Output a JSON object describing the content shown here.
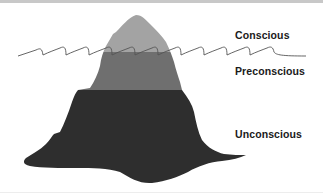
{
  "diagram": {
    "layers": [
      {
        "name": "Conscious",
        "color": "#a3a3a3"
      },
      {
        "name": "Preconscious",
        "color": "#6f6f6f"
      },
      {
        "name": "Unconscious",
        "color": "#2e2e2e"
      }
    ],
    "waterline_color": "#555555",
    "labels": {
      "conscious": "Conscious",
      "preconscious": "Preconscious",
      "unconscious": "Unconscious"
    }
  }
}
